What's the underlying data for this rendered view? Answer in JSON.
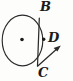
{
  "figure": {
    "kind": "geometry-diagram",
    "background_color": "#fdfdfc",
    "stroke_color": "#2b2b2b",
    "label_color": "#1b1b1b",
    "canvas": {
      "width": 73,
      "height": 81
    }
  },
  "labels": {
    "b": "B",
    "c": "C",
    "d": "D"
  },
  "shapes": {
    "circle": {
      "name": "circle",
      "center_x": 22.5,
      "center_y": 40.5,
      "radius_x": 20.5,
      "radius_y": 25.5,
      "stroke_width": 1.1
    },
    "center_dot": {
      "name": "center-point",
      "x": 22,
      "y": 39.5,
      "radius": 1.7
    },
    "chord_bc": {
      "name": "chord-b-c",
      "x1": 39.2,
      "y1": 18.5,
      "x2": 37.6,
      "y2": 65.8,
      "stroke_width": 1.2
    },
    "point_d": {
      "name": "point-d",
      "x": 43.8,
      "y": 39.2,
      "radius": 1.6
    },
    "ray_from_c": {
      "name": "ray-from-c",
      "x1": 37.6,
      "y1": 66.2,
      "x2": 58.5,
      "y2": 47.5,
      "arrow_tip_x": 60.5,
      "arrow_tip_y": 45.8,
      "stroke_width": 1.2
    }
  }
}
